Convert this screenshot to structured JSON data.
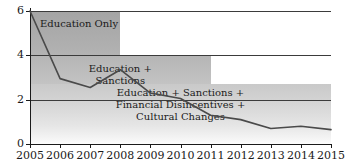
{
  "chart_data": {
    "type": "line",
    "title": "",
    "subtitle": "",
    "xlabel": "",
    "ylabel": "",
    "x": [
      2005,
      2006,
      2007,
      2008,
      2009,
      2010,
      2011,
      2012,
      2013,
      2014,
      2015
    ],
    "values": [
      6.0,
      2.95,
      2.55,
      3.35,
      2.3,
      2.05,
      1.3,
      1.1,
      0.7,
      0.8,
      0.65
    ],
    "series": [
      {
        "name": "rate",
        "values": [
          6.0,
          2.95,
          2.55,
          3.35,
          2.3,
          2.05,
          1.3,
          1.1,
          0.7,
          0.8,
          0.65
        ]
      }
    ],
    "xlim": [
      2005,
      2015
    ],
    "ylim": [
      0,
      6
    ],
    "ytick_labels": [
      "0",
      "2",
      "4",
      "6"
    ],
    "ytick_values": [
      0,
      2,
      4,
      6
    ],
    "xtick_labels": [
      "2005",
      "2006",
      "2007",
      "2008",
      "2009",
      "2010",
      "2011",
      "2012",
      "2013",
      "2014",
      "2015"
    ],
    "grid": "horizontal",
    "legend_position": "none",
    "line_color": "#4a4a4a",
    "annotations": [
      {
        "label": "Education Only",
        "lines": [
          "Education Only"
        ],
        "x_start": 2005,
        "x_end": 2008,
        "y_top": 6.0
      },
      {
        "label": "Education + Sanctions",
        "lines": [
          "Education +",
          "Sanctions"
        ],
        "x_start": 2005,
        "x_end": 2011,
        "y_top": 4.0
      },
      {
        "label": "Education + Sanctions + Financial Disincentives + Cultural Changes",
        "lines": [
          "Education + Sanctions +",
          "Financial Disincentives +",
          "Cultural Changes"
        ],
        "x_start": 2005,
        "x_end": 2015,
        "y_top": 2.7
      }
    ]
  },
  "bands": [
    {
      "name": "education-only",
      "line_1": "Education Only",
      "line_2": "",
      "line_3": "",
      "fill_color": "#a4a4a4"
    },
    {
      "name": "education-sanctions",
      "line_1": "Education +",
      "line_2": "Sanctions",
      "line_3": "",
      "fill_color": "#b5b5b5"
    },
    {
      "name": "education-sanctions-financial-cultural",
      "line_1": "Education + Sanctions +",
      "line_2": "Financial Disincentives +",
      "line_3": "Cultural Changes",
      "fill_color": "#c9c9c9"
    }
  ],
  "axes": {
    "y_ticks": [
      "6",
      "4",
      "2",
      "0"
    ],
    "x_ticks": [
      "2005",
      "2006",
      "2007",
      "2008",
      "2009",
      "2010",
      "2011",
      "2012",
      "2013",
      "2014",
      "2015"
    ]
  }
}
